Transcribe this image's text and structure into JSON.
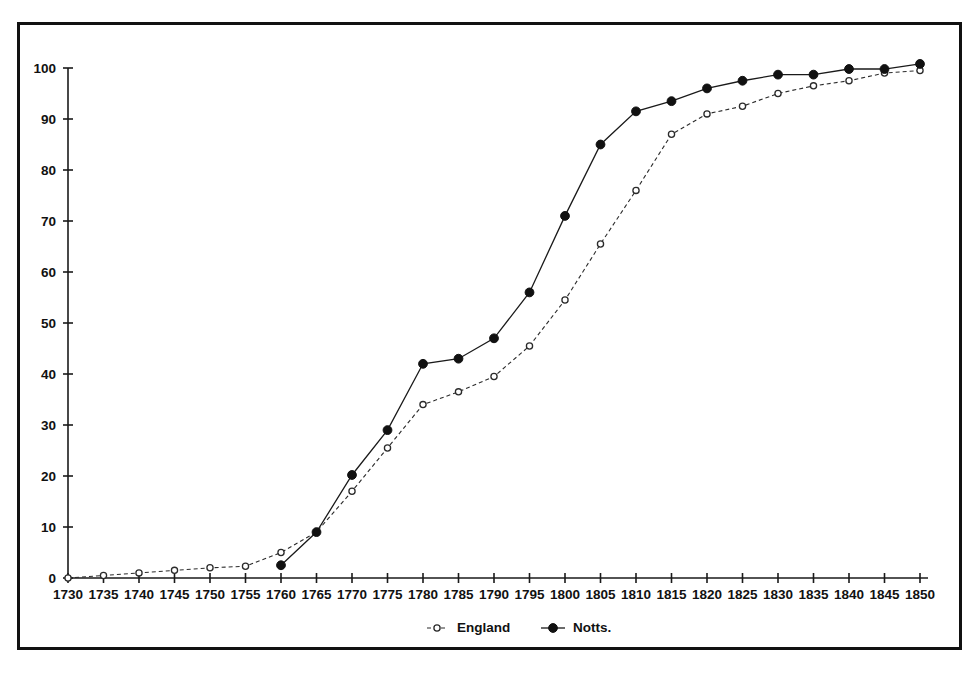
{
  "chart_data": {
    "type": "line",
    "title": "",
    "subtitle": "",
    "xlabel": "",
    "ylabel": "",
    "xlim": [
      1730,
      1850
    ],
    "ylim": [
      0,
      100
    ],
    "grid": false,
    "legend_position": "bottom-center",
    "x": [
      1730,
      1735,
      1740,
      1745,
      1750,
      1755,
      1760,
      1765,
      1770,
      1775,
      1780,
      1785,
      1790,
      1795,
      1800,
      1805,
      1810,
      1815,
      1820,
      1825,
      1830,
      1835,
      1840,
      1845,
      1850
    ],
    "xticklabels": [
      "1730",
      "1735",
      "1740",
      "1745",
      "1750",
      "1755",
      "1760",
      "1765",
      "1770",
      "1775",
      "1780",
      "1785",
      "1790",
      "1795",
      "1800",
      "1805",
      "1810",
      "1815",
      "1820",
      "1825",
      "1830",
      "1835",
      "1840",
      "1845",
      "1850"
    ],
    "yticks": [
      0,
      10,
      20,
      30,
      40,
      50,
      60,
      70,
      80,
      90,
      100
    ],
    "yticklabels": [
      "0",
      "10",
      "20",
      "30",
      "40",
      "50",
      "60",
      "70",
      "80",
      "90",
      "100"
    ],
    "series": [
      {
        "name": "England",
        "marker": "open-circle",
        "linestyle": "dotted",
        "color": "#2b2b2b",
        "x": [
          1730,
          1735,
          1740,
          1745,
          1750,
          1755,
          1760,
          1765,
          1770,
          1775,
          1780,
          1785,
          1790,
          1795,
          1800,
          1805,
          1810,
          1815,
          1820,
          1825,
          1830,
          1835,
          1840,
          1845,
          1850
        ],
        "values": [
          0,
          0.5,
          1,
          1.5,
          2,
          2.3,
          5,
          9,
          17,
          25.5,
          34,
          36.5,
          39.5,
          45.5,
          54.5,
          65.5,
          76,
          87,
          91,
          92.5,
          95,
          96.5,
          97.5,
          99,
          99.5
        ]
      },
      {
        "name": "Notts.",
        "marker": "filled-circle",
        "linestyle": "solid",
        "color": "#111111",
        "x": [
          1760,
          1765,
          1770,
          1775,
          1780,
          1785,
          1790,
          1795,
          1800,
          1805,
          1810,
          1815,
          1820,
          1825,
          1830,
          1835,
          1840,
          1845,
          1850
        ],
        "values": [
          2.5,
          9,
          20.2,
          29,
          42,
          43,
          47,
          56,
          71,
          85,
          91.5,
          93.5,
          96,
          97.5,
          98.7,
          98.7,
          99.8,
          99.8,
          100.8
        ]
      }
    ],
    "legend": [
      {
        "label": "England",
        "marker": "open-circle",
        "linestyle": "dotted"
      },
      {
        "label": "Notts.",
        "marker": "filled-circle",
        "linestyle": "solid"
      }
    ]
  }
}
